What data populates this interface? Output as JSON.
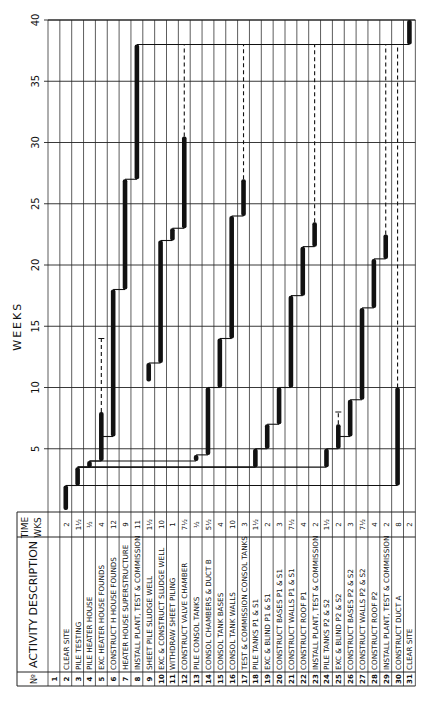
{
  "chart_data": {
    "type": "gantt",
    "title": "",
    "axis_label": "WEEKS",
    "axis_ticks": [
      5,
      10,
      15,
      20,
      25,
      30,
      35,
      40
    ],
    "axis_range": [
      0,
      40
    ],
    "orientation": "rotated-90-ccw",
    "columns": {
      "no": "Nº",
      "description": "ACTIVITY DESCRIPTION",
      "time": "TIME",
      "time_unit": "WKS"
    },
    "activities": [
      {
        "no": "1",
        "description": "",
        "time": "",
        "start": null,
        "end": null,
        "float_end": null
      },
      {
        "no": "2",
        "description": "CLEAR SITE",
        "time": "2",
        "start": 0,
        "end": 2,
        "float_end": null
      },
      {
        "no": "3",
        "description": "PILE TESTING",
        "time": "1½",
        "start": 2,
        "end": 3.5,
        "float_end": null
      },
      {
        "no": "4",
        "description": "PILE HEATER HOUSE",
        "time": "½",
        "start": 3.5,
        "end": 4,
        "float_end": null
      },
      {
        "no": "5",
        "description": "EXC HEATER HOUSE FOUNDS",
        "time": "4",
        "start": 4,
        "end": 8,
        "float_end": 14
      },
      {
        "no": "6",
        "description": "CONSTRUCT H HOUSE FOUNDS",
        "time": "12",
        "start": 6,
        "end": 18,
        "float_end": null
      },
      {
        "no": "7",
        "description": "HEATER HOUSE SUPERSTRUCTURE",
        "time": "9",
        "start": 18,
        "end": 27,
        "float_end": null
      },
      {
        "no": "8",
        "description": "INSTALL PLANT, TEST & COMMISSION",
        "time": "11",
        "start": 27,
        "end": 38,
        "float_end": null
      },
      {
        "no": "9",
        "description": "SHEET PILE SLUDGE WELL",
        "time": "1½",
        "start": 10.5,
        "end": 12,
        "float_end": null
      },
      {
        "no": "10",
        "description": "EXC & CONSTRUCT SLUDGE WELL",
        "time": "10",
        "start": 12,
        "end": 22,
        "float_end": null
      },
      {
        "no": "11",
        "description": "WITHDRAW SHEET PILING",
        "time": "1",
        "start": 22,
        "end": 23,
        "float_end": null
      },
      {
        "no": "12",
        "description": "CONSTRUCT VALVE CHAMBER",
        "time": "7½",
        "start": 23,
        "end": 30.5,
        "float_end": 38
      },
      {
        "no": "13",
        "description": "PILE CONSOL TANKS",
        "time": "½",
        "start": 4,
        "end": 4.5,
        "float_end": null
      },
      {
        "no": "14",
        "description": "CONSOL CHAMBERS & DUCT B",
        "time": "5½",
        "start": 4.5,
        "end": 10,
        "float_end": null
      },
      {
        "no": "15",
        "description": "CONSOL TANK BASES",
        "time": "4",
        "start": 10,
        "end": 14,
        "float_end": null
      },
      {
        "no": "16",
        "description": "CONSOL TANK WALLS",
        "time": "10",
        "start": 14,
        "end": 24,
        "float_end": null
      },
      {
        "no": "17",
        "description": "TEST & COMMISSION CONSOL TANKS",
        "time": "3",
        "start": 24,
        "end": 27,
        "float_end": 38
      },
      {
        "no": "18",
        "description": "PILE TANKS P1 & S1",
        "time": "1½",
        "start": 3.5,
        "end": 5,
        "float_end": null
      },
      {
        "no": "19",
        "description": "EXC & BLIND P1 & S1",
        "time": "2",
        "start": 5,
        "end": 7,
        "float_end": null
      },
      {
        "no": "20",
        "description": "CONSTRUCT BASES P1 & S1",
        "time": "3",
        "start": 7,
        "end": 10,
        "float_end": null
      },
      {
        "no": "21",
        "description": "CONSTRUCT WALLS P1 & S1",
        "time": "7½",
        "start": 10,
        "end": 17.5,
        "float_end": null
      },
      {
        "no": "22",
        "description": "CONSTRUCT ROOF P1",
        "time": "4",
        "start": 17.5,
        "end": 21.5,
        "float_end": null
      },
      {
        "no": "23",
        "description": "INSTALL PLANT, TEST & COMMISSION",
        "time": "2",
        "start": 21.5,
        "end": 23.5,
        "float_end": 38
      },
      {
        "no": "24",
        "description": "PILE TANKS P2 & S2",
        "time": "1½",
        "start": 3.5,
        "end": 5,
        "float_end": null
      },
      {
        "no": "25",
        "description": "EXC & BLIND P2 & S2",
        "time": "2",
        "start": 5,
        "end": 7,
        "float_end": 8
      },
      {
        "no": "26",
        "description": "CONSTRUCT BASES P2 & S2",
        "time": "3",
        "start": 6,
        "end": 9,
        "float_end": null
      },
      {
        "no": "27",
        "description": "CONSTRUCT WALLS P2 & S2",
        "time": "7½",
        "start": 9,
        "end": 16.5,
        "float_end": null
      },
      {
        "no": "28",
        "description": "CONSTRUCT ROOF P2",
        "time": "4",
        "start": 16.5,
        "end": 20.5,
        "float_end": null
      },
      {
        "no": "29",
        "description": "INSTALL PLANT, TEST & COMMISSION",
        "time": "2",
        "start": 20.5,
        "end": 22.5,
        "float_end": 38
      },
      {
        "no": "30",
        "description": "CONSTRUCT DUCT A",
        "time": "8",
        "start": 2,
        "end": 10,
        "float_end": 38
      },
      {
        "no": "31",
        "description": "CLEAR SITE",
        "time": "2",
        "start": 38,
        "end": 40,
        "float_end": null
      }
    ],
    "links": [
      [
        2,
        3
      ],
      [
        3,
        4
      ],
      [
        4,
        5
      ],
      [
        5,
        6
      ],
      [
        6,
        7
      ],
      [
        7,
        8
      ],
      [
        9,
        10
      ],
      [
        10,
        11
      ],
      [
        11,
        12
      ],
      [
        4,
        13
      ],
      [
        13,
        14
      ],
      [
        14,
        15
      ],
      [
        15,
        16
      ],
      [
        16,
        17
      ],
      [
        3,
        18
      ],
      [
        18,
        19
      ],
      [
        19,
        20
      ],
      [
        20,
        21
      ],
      [
        21,
        22
      ],
      [
        22,
        23
      ],
      [
        3,
        24
      ],
      [
        24,
        25
      ],
      [
        25,
        26
      ],
      [
        26,
        27
      ],
      [
        27,
        28
      ],
      [
        28,
        29
      ],
      [
        2,
        30
      ],
      [
        8,
        31
      ]
    ],
    "grid": true,
    "legend": null
  }
}
